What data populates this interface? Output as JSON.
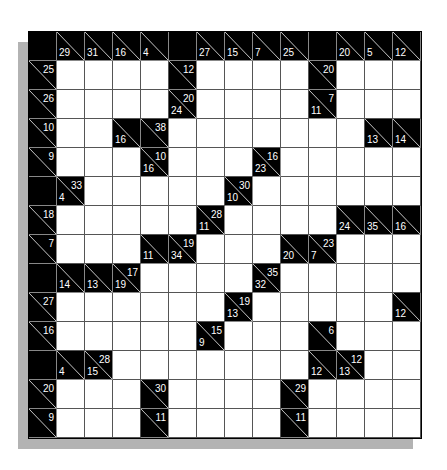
{
  "puzzle": {
    "type": "kakuro",
    "rows": 14,
    "cols": 14,
    "colors": {
      "block": "#000000",
      "empty": "#ffffff",
      "clue_text": "#ffffff",
      "shadow": "#b3b3b3"
    },
    "legend": "Cell codes: 'W' = empty white cell; 'B' = black cell without clue; object = clue cell with optional right (across) and down sums",
    "grid": [
      [
        "B",
        {
          "d": "29"
        },
        {
          "d": "31"
        },
        {
          "d": "16"
        },
        {
          "d": "4"
        },
        "B",
        {
          "d": "27"
        },
        {
          "d": "15"
        },
        {
          "d": "7"
        },
        {
          "d": "25"
        },
        "B",
        {
          "d": "20"
        },
        {
          "d": "5"
        },
        {
          "d": "12"
        }
      ],
      [
        {
          "r": "25"
        },
        "W",
        "W",
        "W",
        "W",
        {
          "r": "12"
        },
        "W",
        "W",
        "W",
        "W",
        {
          "r": "20"
        },
        "W",
        "W",
        "W"
      ],
      [
        {
          "r": "26"
        },
        "W",
        "W",
        "W",
        "W",
        {
          "r": "20",
          "d": "24"
        },
        "W",
        "W",
        "W",
        "W",
        {
          "r": "7",
          "d": "11"
        },
        "W",
        "W",
        "W"
      ],
      [
        {
          "r": "10"
        },
        "W",
        "W",
        {
          "d": "16"
        },
        {
          "r": "38"
        },
        "W",
        "W",
        "W",
        "W",
        "W",
        "W",
        "W",
        {
          "d": "13"
        },
        {
          "d": "14"
        }
      ],
      [
        {
          "r": "9"
        },
        "W",
        "W",
        "W",
        {
          "r": "10",
          "d": "16"
        },
        "W",
        "W",
        "W",
        {
          "r": "16",
          "d": "23"
        },
        "W",
        "W",
        "W",
        "W",
        "W"
      ],
      [
        "B",
        {
          "r": "33",
          "d": "4"
        },
        "W",
        "W",
        "W",
        "W",
        "W",
        {
          "r": "30",
          "d": "10"
        },
        "W",
        "W",
        "W",
        "W",
        "W",
        "W"
      ],
      [
        {
          "r": "18"
        },
        "W",
        "W",
        "W",
        "W",
        "W",
        {
          "r": "28",
          "d": "11"
        },
        "W",
        "W",
        "W",
        "W",
        {
          "d": "24"
        },
        {
          "d": "35"
        },
        {
          "d": "16"
        }
      ],
      [
        {
          "r": "7"
        },
        "W",
        "W",
        "W",
        {
          "d": "11"
        },
        {
          "r": "19",
          "d": "34"
        },
        "W",
        "W",
        "W",
        {
          "d": "20"
        },
        {
          "r": "23",
          "d": "7"
        },
        "W",
        "W",
        "W"
      ],
      [
        "B",
        {
          "d": "14"
        },
        {
          "d": "13"
        },
        {
          "r": "17",
          "d": "19"
        },
        "W",
        "W",
        "W",
        "W",
        {
          "r": "35",
          "d": "32"
        },
        "W",
        "W",
        "W",
        "W",
        "W"
      ],
      [
        {
          "r": "27"
        },
        "W",
        "W",
        "W",
        "W",
        "W",
        "W",
        {
          "r": "19",
          "d": "13"
        },
        "W",
        "W",
        "W",
        "W",
        "W",
        {
          "d": "12"
        }
      ],
      [
        {
          "r": "16"
        },
        "W",
        "W",
        "W",
        "W",
        "W",
        {
          "r": "15",
          "d": "9"
        },
        "W",
        "W",
        "W",
        {
          "r": "6"
        },
        "W",
        "W",
        "W"
      ],
      [
        "B",
        {
          "d": "4"
        },
        {
          "r": "28",
          "d": "15"
        },
        "W",
        "W",
        "W",
        "W",
        "W",
        "W",
        "W",
        {
          "d": "12"
        },
        {
          "r": "12",
          "d": "13"
        },
        "W",
        "W"
      ],
      [
        {
          "r": "20"
        },
        "W",
        "W",
        "W",
        {
          "r": "30"
        },
        "W",
        "W",
        "W",
        "W",
        {
          "r": "29"
        },
        "W",
        "W",
        "W",
        "W"
      ],
      [
        {
          "r": "9"
        },
        "W",
        "W",
        "W",
        {
          "r": "11"
        },
        "W",
        "W",
        "W",
        "W",
        {
          "r": "11"
        },
        "W",
        "W",
        "W",
        "W"
      ]
    ]
  }
}
